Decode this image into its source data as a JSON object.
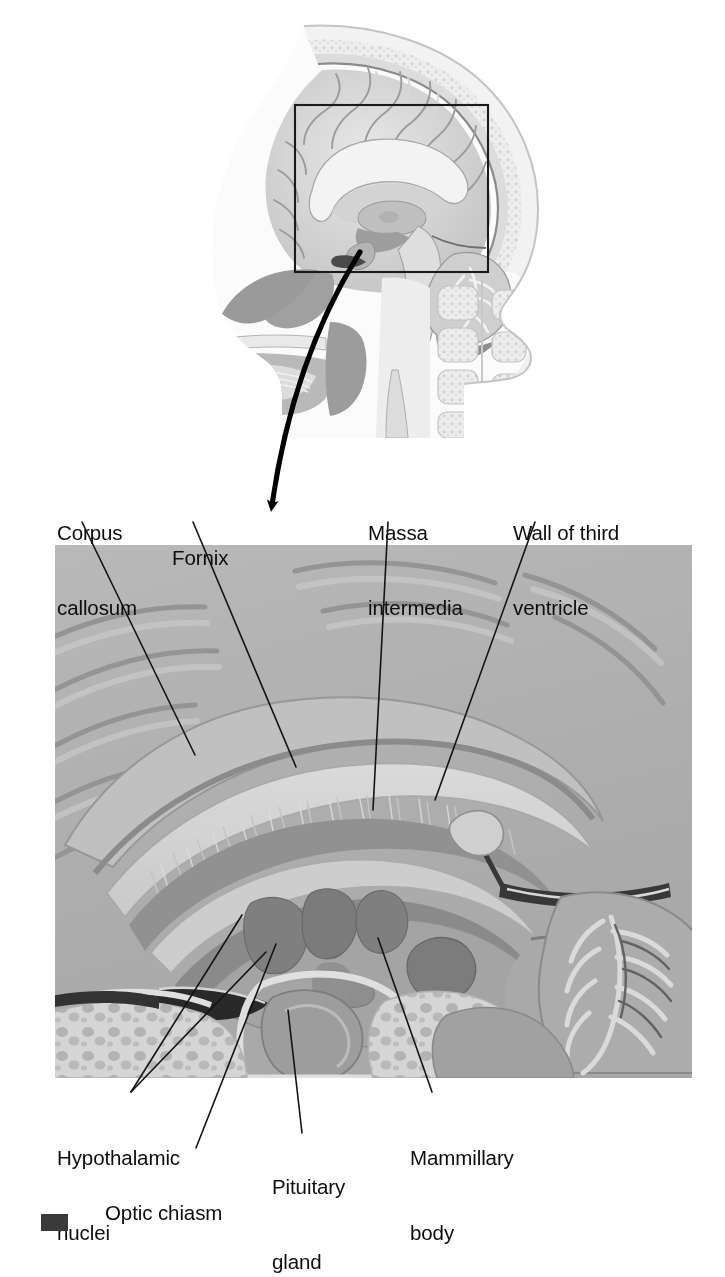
{
  "figure": {
    "orientation_note": "Upper panel: midsagittal section of the head with boxed region of interest. Lower panel: enlargement of the boxed region.",
    "background_color": "#ffffff",
    "ink_color": "#0d0d0d"
  },
  "inset": {
    "name": "region-of-interest-box",
    "description": "Rectangle on the head section marking the area enlarged below",
    "stroke_color": "#1a1a1a"
  },
  "pointer": {
    "name": "magnification-arrow",
    "description": "Curved arrow leading from the boxed region down to the enlargement",
    "color": "#000000"
  },
  "labels": {
    "top": [
      {
        "id": "corpus-callosum",
        "line1": "Corpus",
        "line2": "callosum",
        "x": 57,
        "y": 470
      },
      {
        "id": "fornix",
        "line1": "Fornix",
        "line2": "",
        "x": 172,
        "y": 495
      },
      {
        "id": "massa-intermedia",
        "line1": "Massa",
        "line2": "intermedia",
        "x": 368,
        "y": 470
      },
      {
        "id": "wall-third-ventricle",
        "line1": "Wall of third",
        "line2": "ventricle",
        "x": 513,
        "y": 470
      }
    ],
    "bottom": [
      {
        "id": "hypothalamic-nuclei",
        "line1": "Hypothalamic",
        "line2": "nuclei",
        "x": 57,
        "y": 1103
      },
      {
        "id": "optic-chiasm",
        "line1": "Optic chiasm",
        "line2": "",
        "x": 105,
        "y": 1157
      },
      {
        "id": "pituitary-gland",
        "line1": "Pituitary",
        "line2": "gland",
        "x": 272,
        "y": 1143
      },
      {
        "id": "mammillary-body",
        "line1": "Mammillary",
        "line2": "body",
        "x": 410,
        "y": 1103
      }
    ]
  },
  "leaders": {
    "description": "Thin black leader lines connecting each label to its structure",
    "stroke_color": "#141414",
    "stroke_width": 1.5
  },
  "anatomy": {
    "upper_panel_structures": [
      "scalp",
      "skull",
      "cerebrum",
      "corpus callosum",
      "cerebellum",
      "brainstem",
      "nasal cavity",
      "tongue",
      "cervical vertebrae",
      "spinal cord"
    ],
    "lower_panel_structures": [
      "corpus callosum",
      "fornix",
      "massa intermedia",
      "wall of third ventricle",
      "hypothalamic nuclei",
      "optic chiasm",
      "pituitary gland",
      "mammillary body",
      "midbrain",
      "pons",
      "cerebellum",
      "sphenoid sinus"
    ]
  },
  "palette": {
    "tissue_light": "#e3e3e3",
    "tissue_mid": "#c6c6c6",
    "tissue_dark": "#a2a2a2",
    "tissue_darker": "#8a8a8a",
    "cavity_dark": "#7d7d7d",
    "outline": "#6f6f6f",
    "white_matter": "#efefef"
  }
}
